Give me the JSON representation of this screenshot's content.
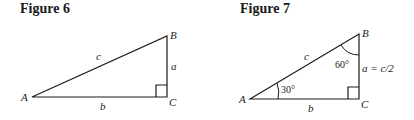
{
  "figures": [
    {
      "title": "Figure 6",
      "vertices": {
        "A": "A",
        "B": "B",
        "C": "C"
      },
      "sides": {
        "hypotenuse": "c",
        "vertical": "a",
        "base": "b"
      },
      "right_angle_at": "C"
    },
    {
      "title": "Figure 7",
      "vertices": {
        "A": "A",
        "B": "B",
        "C": "C"
      },
      "sides": {
        "hypotenuse": "c",
        "vertical": "a = c/2",
        "base": "b"
      },
      "angles": {
        "A": "30°",
        "B": "60°"
      },
      "right_angle_at": "C"
    }
  ],
  "colors": {
    "stroke": "#1a1a1a",
    "background": "#ffffff"
  }
}
